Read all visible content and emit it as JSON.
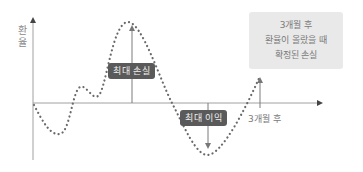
{
  "diagram": {
    "y_axis_label": "환율",
    "y_axis_label_chars": [
      "환",
      "율"
    ],
    "max_loss_label": "최대 손실",
    "max_gain_label": "최대 이익",
    "x_tick_label": "3개월 후",
    "note": {
      "line1": "3개월 후",
      "line2": "환율이 올랐을 때",
      "line3": "확정된 손실"
    },
    "colors": {
      "axis": "#9a9a9a",
      "dots": "#6a6a6a",
      "arrow": "#7a7a7a",
      "tag_bg": "#5a5a5a",
      "note_bg": "#e9e9e9"
    }
  }
}
